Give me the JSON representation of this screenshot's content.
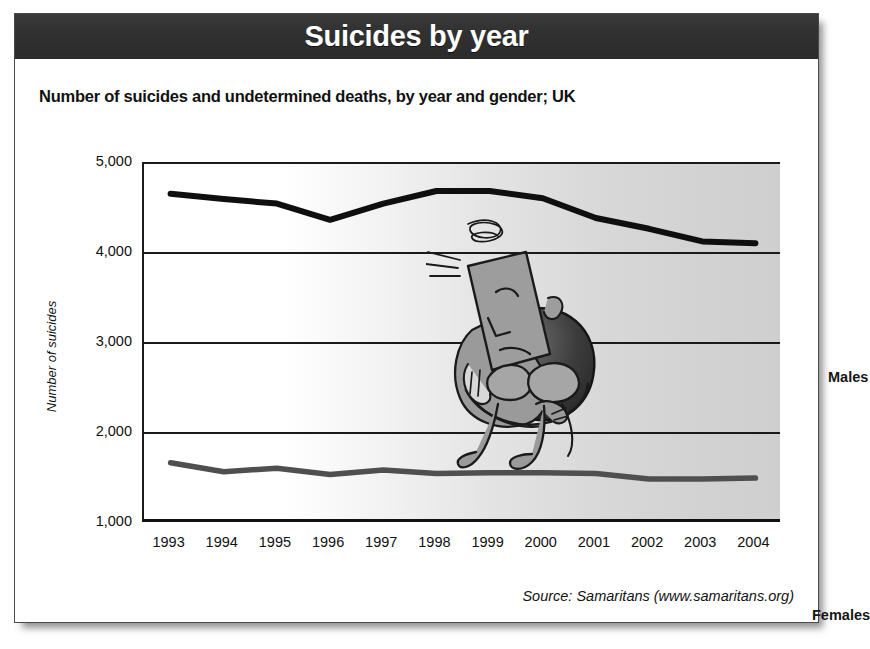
{
  "banner": {
    "title": "Suicides by year"
  },
  "subtitle": "Number of suicides and undetermined deaths, by year and gender; UK",
  "source_note": "Source: Samaritans (www.samaritans.org)",
  "labels": {
    "males": "Males",
    "females": "Females"
  },
  "illustration": {
    "name": "dejected-person-hugging-knees",
    "description": "Cartoon of a seated person hugging their knees with head bowed"
  },
  "colors": {
    "banner_background": "#2f2f2f",
    "banner_text": "#ffffff",
    "males_line": "#0f0f0f",
    "females_line": "#4f4f4f",
    "axis": "#111111",
    "plot_background_left": "#ffffff",
    "plot_background_right": "#cfcfcf",
    "card_border": "#4a4a4a"
  },
  "chart_data": {
    "type": "line",
    "title": "Suicides by year",
    "subtitle": "Number of suicides and undetermined deaths, by year and gender; UK",
    "xlabel": "",
    "ylabel": "Number of suicides",
    "x": [
      1993,
      1994,
      1995,
      1996,
      1997,
      1998,
      1999,
      2000,
      2001,
      2002,
      2003,
      2004
    ],
    "xticklabels": [
      "1993",
      "1994",
      "1995",
      "1996",
      "1997",
      "1998",
      "1999",
      "2000",
      "2001",
      "2002",
      "2003",
      "2004"
    ],
    "yticks": [
      1000,
      2000,
      3000,
      4000,
      5000
    ],
    "yticklabels": [
      "1,000",
      "2,000",
      "3,000",
      "4,000",
      "5,000"
    ],
    "ylim": [
      1000,
      5000
    ],
    "grid": true,
    "legend": "inline-end-labels",
    "series": [
      {
        "name": "Males",
        "color": "#0f0f0f",
        "values": [
          4670,
          4610,
          4560,
          4380,
          4560,
          4700,
          4700,
          4620,
          4400,
          4280,
          4140,
          4120
        ]
      },
      {
        "name": "Females",
        "color": "#4f4f4f",
        "values": [
          1680,
          1580,
          1620,
          1550,
          1600,
          1560,
          1570,
          1570,
          1560,
          1500,
          1500,
          1510
        ]
      }
    ],
    "annotations": [
      "Males",
      "Females"
    ]
  }
}
